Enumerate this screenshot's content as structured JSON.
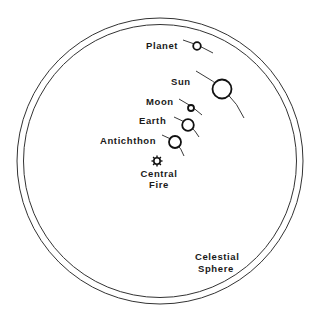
{
  "diagram": {
    "labels": {
      "planet": "Planet",
      "sun": "Sun",
      "moon": "Moon",
      "earth": "Earth",
      "antichthon": "Antichthon",
      "central_fire_line1": "Central",
      "central_fire_line2": "Fire",
      "celestial_line1": "Celestial",
      "celestial_line2": "Sphere"
    },
    "bodies": [
      {
        "name": "Planet",
        "cx": 197,
        "cy": 46,
        "r": 4
      },
      {
        "name": "Sun",
        "cx": 222,
        "cy": 89,
        "r": 9.5
      },
      {
        "name": "Moon",
        "cx": 191,
        "cy": 108,
        "r": 3
      },
      {
        "name": "Earth",
        "cx": 188,
        "cy": 125,
        "r": 6
      },
      {
        "name": "Antichthon",
        "cx": 175,
        "cy": 142,
        "r": 6
      },
      {
        "name": "Central Fire",
        "cx": 157,
        "cy": 161,
        "r": 3.5
      }
    ],
    "celestial_sphere": {
      "cx": 160,
      "cy": 161,
      "outer_r": 143,
      "inner_r": 136
    },
    "colors": {
      "ink": "#111111",
      "background": "#ffffff"
    }
  }
}
